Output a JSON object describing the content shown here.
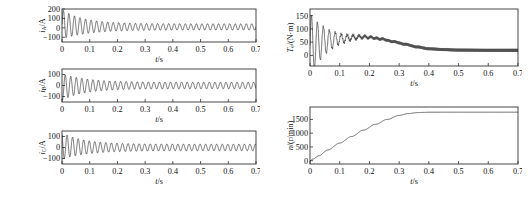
{
  "figure": {
    "background": "#ffffff",
    "line_color": "#1a1a1a",
    "axis_color": "#333333",
    "width": 532,
    "height": 199
  },
  "chart_data": [
    {
      "id": "phase-a-current",
      "type": "line",
      "title": "",
      "xlabel": "t/s",
      "ylabel": "i_A/A",
      "ylabel_main": "i",
      "ylabel_sub": "A",
      "ylabel_unit": "/A",
      "xlim": [
        0,
        0.7
      ],
      "ylim": [
        -150,
        200
      ],
      "xticks": [
        0,
        0.1,
        0.2,
        0.3,
        0.4,
        0.5,
        0.6,
        0.7
      ],
      "xticklabels": [
        "0",
        "0.1",
        "0.2",
        "0.3",
        "0.4",
        "0.5",
        "0.6",
        "0.7"
      ],
      "yticks": [
        -100,
        0,
        100,
        200
      ],
      "yticklabels": [
        "-100",
        "0",
        "100",
        "200"
      ],
      "grid": false,
      "legend": null,
      "waveform": {
        "kind": "damped_sine",
        "frequency_hz": 50,
        "phase_deg": 0,
        "envelope_start": 155,
        "envelope_end": 33,
        "decay_time_constant_s": 0.085,
        "offset": 10,
        "dc_offset_start": 30,
        "dc_decay_s": 0.05
      }
    },
    {
      "id": "phase-b-current",
      "type": "line",
      "title": "",
      "xlabel": "t/s",
      "ylabel": "i_B/A",
      "ylabel_main": "i",
      "ylabel_sub": "B",
      "ylabel_unit": "/A",
      "xlim": [
        0,
        0.7
      ],
      "ylim": [
        -150,
        150
      ],
      "xticks": [
        0,
        0.1,
        0.2,
        0.3,
        0.4,
        0.5,
        0.6,
        0.7
      ],
      "xticklabels": [
        "0",
        "0.1",
        "0.2",
        "0.3",
        "0.4",
        "0.5",
        "0.6",
        "0.7"
      ],
      "yticks": [
        -100,
        0,
        100
      ],
      "yticklabels": [
        "-100",
        "0",
        "100"
      ],
      "grid": false,
      "legend": null,
      "waveform": {
        "kind": "damped_sine",
        "frequency_hz": 50,
        "phase_deg": 240,
        "envelope_start": 120,
        "envelope_end": 30,
        "decay_time_constant_s": 0.085,
        "offset": 0,
        "dc_offset_start": -15,
        "dc_decay_s": 0.05
      }
    },
    {
      "id": "phase-c-current",
      "type": "line",
      "title": "",
      "xlabel": "t/s",
      "ylabel": "i_C/A",
      "ylabel_main": "i",
      "ylabel_sub": "C",
      "ylabel_unit": "/A",
      "xlim": [
        0,
        0.7
      ],
      "ylim": [
        -150,
        150
      ],
      "xticks": [
        0,
        0.1,
        0.2,
        0.3,
        0.4,
        0.5,
        0.6,
        0.7
      ],
      "xticklabels": [
        "0",
        "0.1",
        "0.2",
        "0.3",
        "0.4",
        "0.5",
        "0.6",
        "0.7"
      ],
      "yticks": [
        -100,
        0,
        100
      ],
      "yticklabels": [
        "-100",
        "0",
        "100"
      ],
      "grid": false,
      "legend": null,
      "waveform": {
        "kind": "damped_sine",
        "frequency_hz": 50,
        "phase_deg": 120,
        "envelope_start": 120,
        "envelope_end": 30,
        "decay_time_constant_s": 0.085,
        "offset": 0,
        "dc_offset_start": 15,
        "dc_decay_s": 0.05
      }
    },
    {
      "id": "electromagnetic-torque",
      "type": "line",
      "title": "",
      "xlabel": "t/s",
      "ylabel": "T_e/(N·m)",
      "ylabel_main": "T",
      "ylabel_sub": "e",
      "ylabel_unit": "/(N·m)",
      "xlim": [
        0,
        0.7
      ],
      "ylim": [
        -40,
        175
      ],
      "xticks": [
        0,
        0.1,
        0.2,
        0.3,
        0.4,
        0.5,
        0.6,
        0.7
      ],
      "xticklabels": [
        "0",
        "0.1",
        "0.2",
        "0.3",
        "0.4",
        "0.5",
        "0.6",
        "0.7"
      ],
      "yticks": [
        0,
        50,
        100,
        150
      ],
      "yticklabels": [
        "0",
        "50",
        "100",
        "150"
      ],
      "grid": false,
      "legend": null,
      "waveform": {
        "kind": "torque_transient",
        "frequency_hz": 50,
        "peak": 160,
        "osc_decay_s": 0.055,
        "mean_points_t": [
          0,
          0.02,
          0.05,
          0.1,
          0.15,
          0.18,
          0.2,
          0.24,
          0.28,
          0.32,
          0.36,
          0.4,
          0.45,
          0.5,
          0.6,
          0.7
        ],
        "mean_points_v": [
          35,
          45,
          55,
          62,
          68,
          70,
          68,
          62,
          52,
          42,
          32,
          25,
          22,
          20,
          19,
          19
        ],
        "ripple_start": 5,
        "ripple_end": 6
      }
    },
    {
      "id": "rotor-speed",
      "type": "line",
      "title": "",
      "xlabel": "t/s",
      "ylabel": "n/(r/min)",
      "ylabel_main": "n",
      "ylabel_sub": "",
      "ylabel_unit": "/(r/min)",
      "xlim": [
        0,
        0.7
      ],
      "ylim": [
        -120,
        1950
      ],
      "xticks": [
        0,
        0.1,
        0.2,
        0.3,
        0.4,
        0.5,
        0.6,
        0.7
      ],
      "xticklabels": [
        "0",
        "0.1",
        "0.2",
        "0.3",
        "0.4",
        "0.5",
        "0.6",
        "0.7"
      ],
      "yticks": [
        0,
        500,
        1000,
        1500
      ],
      "yticklabels": [
        "0",
        "500",
        "1000",
        "1500"
      ],
      "grid": false,
      "legend": null,
      "waveform": {
        "kind": "speed_ramp",
        "points_t": [
          0,
          0.01,
          0.03,
          0.06,
          0.1,
          0.14,
          0.18,
          0.22,
          0.26,
          0.3,
          0.33,
          0.36,
          0.38,
          0.4,
          0.45,
          0.5,
          0.6,
          0.7
        ],
        "points_v": [
          0,
          60,
          180,
          390,
          640,
          880,
          1110,
          1320,
          1500,
          1645,
          1710,
          1745,
          1755,
          1760,
          1762,
          1762,
          1762,
          1762
        ]
      }
    }
  ],
  "panels": [
    {
      "id": "phase-a-current",
      "name": "panel-phase-a-current",
      "x": 38,
      "y": 6,
      "w": 222,
      "h": 58
    },
    {
      "id": "phase-b-current",
      "name": "panel-phase-b-current",
      "x": 38,
      "y": 66,
      "w": 222,
      "h": 58
    },
    {
      "id": "phase-c-current",
      "name": "panel-phase-c-current",
      "x": 38,
      "y": 128,
      "w": 222,
      "h": 58
    },
    {
      "id": "electromagnetic-torque",
      "name": "panel-electromagnetic-torque",
      "x": 286,
      "y": 6,
      "w": 236,
      "h": 82
    },
    {
      "id": "rotor-speed",
      "name": "panel-rotor-speed",
      "x": 286,
      "y": 104,
      "w": 236,
      "h": 82
    }
  ]
}
